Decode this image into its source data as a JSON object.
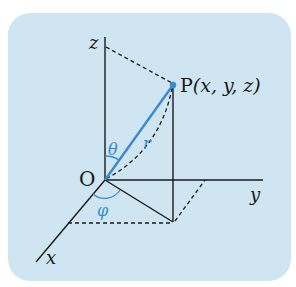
{
  "figure": {
    "type": "spherical-coordinates-diagram",
    "background_color": "#cfe5f2",
    "line_color": "#1a1a1a",
    "accent_color": "#3b8ad0",
    "labels": {
      "origin": "O",
      "point": "P(x, y, z)",
      "point_name": "P",
      "point_coords": "(x, y, z)",
      "axis_x": "x",
      "axis_y": "y",
      "axis_z": "z",
      "radius": "r",
      "polar_angle": "θ",
      "azimuth_angle": "φ"
    }
  }
}
